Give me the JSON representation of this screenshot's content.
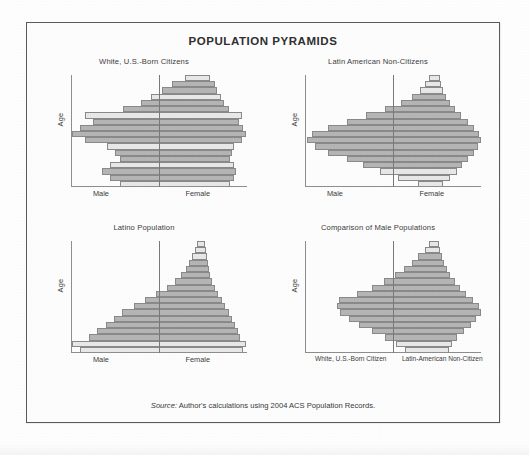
{
  "figure": {
    "title": "POPULATION PYRAMIDS",
    "source_prefix": "Source:",
    "source_text": " Author's calculations using 2004 ACS Population Records.",
    "axis_y_label": "Age",
    "bar_fill_dark": "#b6b6b6",
    "bar_fill_light": "#e9e9e9",
    "bar_stroke": "#8a8a8a",
    "border_color": "#5b5b5b"
  },
  "panels": {
    "top_left": {
      "title": "White, U.S.-Born Citizens",
      "x_left_label": "Male",
      "x_right_label": "Female"
    },
    "top_right": {
      "title": "Latin American Non-Citizens",
      "x_left_label": "Male",
      "x_right_label": "Female"
    },
    "bottom_left": {
      "title": "Latino Population",
      "x_left_label": "Male",
      "x_right_label": "Female"
    },
    "bottom_right": {
      "title": "Comparison of Male Populations",
      "x_left_label": "White, U.S.-Born Citizen",
      "x_right_label": "Latin-American Non-Citizen"
    }
  },
  "chart_data": [
    {
      "id": "top_left",
      "type": "bar",
      "orientation": "horizontal-diverging",
      "title": "White, U.S.-Born Citizens",
      "xlabel_left": "Male",
      "xlabel_right": "Female",
      "ylabel": "Age",
      "grid": false,
      "legend": "none",
      "note": "Values are relative population share per 5-year age band, youngest at bottom. Highlighted (light) rows are visually lighter bars in the scan.",
      "categories": [
        "0-4",
        "5-9",
        "10-14",
        "15-19",
        "20-24",
        "25-29",
        "30-34",
        "35-39",
        "40-44",
        "45-49",
        "50-54",
        "55-59",
        "60-64",
        "65-69",
        "70-74",
        "75-79",
        "80-84",
        "85+"
      ],
      "left_values": [
        31,
        35,
        38,
        35,
        31,
        33,
        36,
        44,
        49,
        46,
        41,
        44,
        30,
        23,
        19,
        15,
        11,
        6
      ],
      "right_values": [
        30,
        34,
        37,
        34,
        30,
        32,
        35,
        43,
        48,
        45,
        40,
        43,
        29,
        23,
        20,
        16,
        13,
        8
      ],
      "light_rows": [
        0,
        3,
        6,
        11,
        14,
        17
      ]
    },
    {
      "id": "top_right",
      "type": "bar",
      "orientation": "horizontal-diverging",
      "title": "Latin American Non-Citizens",
      "xlabel_left": "Male",
      "xlabel_right": "Female",
      "ylabel": "Age",
      "grid": false,
      "legend": "none",
      "note": "Spindle/diamond shape: very large working-age bulge, tall narrow spike of small elderly bands at top.",
      "categories": [
        "0-4",
        "5-9",
        "10-14",
        "15-19",
        "20-24",
        "25-29",
        "30-34",
        "35-39",
        "40-44",
        "45-49",
        "50-54",
        "55-59",
        "60-64",
        "65-69",
        "70-74",
        "75-79",
        "80-84",
        "85+"
      ],
      "left_values": [
        7,
        14,
        21,
        27,
        33,
        40,
        45,
        48,
        46,
        40,
        33,
        26,
        19,
        13,
        9,
        6,
        4,
        3
      ],
      "right_values": [
        7,
        15,
        22,
        28,
        34,
        41,
        46,
        49,
        47,
        41,
        34,
        27,
        20,
        14,
        10,
        7,
        5,
        3
      ],
      "light_rows": [
        0,
        1,
        2,
        15,
        16,
        17
      ]
    },
    {
      "id": "bottom_left",
      "type": "bar",
      "orientation": "horizontal-diverging",
      "title": "Latino Population",
      "xlabel_left": "Male",
      "xlabel_right": "Female",
      "ylabel": "Age",
      "grid": false,
      "legend": "none",
      "note": "Classic expansive pyramid: widest at youngest ages, tapering steadily to a narrow spike at the oldest ages.",
      "categories": [
        "0-4",
        "5-9",
        "10-14",
        "15-19",
        "20-24",
        "25-29",
        "30-34",
        "35-39",
        "40-44",
        "45-49",
        "50-54",
        "55-59",
        "60-64",
        "65-69",
        "70-74",
        "75-79",
        "80-84",
        "85+"
      ],
      "left_values": [
        44,
        47,
        41,
        38,
        35,
        32,
        29,
        25,
        21,
        17,
        13,
        10,
        8,
        6,
        5,
        4,
        3,
        2
      ],
      "right_values": [
        43,
        46,
        40,
        37,
        34,
        31,
        28,
        24,
        20,
        16,
        13,
        10,
        8,
        6,
        5,
        4,
        3,
        2
      ],
      "light_rows": [
        0,
        1,
        15,
        16,
        17
      ]
    },
    {
      "id": "bottom_right",
      "type": "bar",
      "orientation": "horizontal-diverging",
      "title": "Comparison of Male Populations",
      "xlabel_left": "White, U.S.-Born Citizen",
      "xlabel_right": "Latin-American Non-Citizen",
      "ylabel": "Age",
      "grid": false,
      "legend": "none",
      "note": "Asymmetric: left side (White U.S.-born males) is pyramid-shaped; right side (Latin-American non-citizen males) bulges strongly in prime working ages.",
      "categories": [
        "0-4",
        "5-9",
        "10-14",
        "15-19",
        "20-24",
        "25-29",
        "30-34",
        "35-39",
        "40-44",
        "45-49",
        "50-54",
        "55-59",
        "60-64",
        "65-69",
        "70-74",
        "75-79",
        "80-84",
        "85+"
      ],
      "left_values": [
        18,
        22,
        28,
        33,
        38,
        42,
        46,
        50,
        54,
        44,
        36,
        30,
        25,
        20,
        16,
        12,
        8,
        5
      ],
      "right_values": [
        20,
        26,
        34,
        46,
        58,
        68,
        76,
        72,
        62,
        50,
        40,
        31,
        23,
        17,
        12,
        8,
        5,
        3
      ],
      "light_rows": [
        0,
        1,
        16,
        17
      ]
    }
  ]
}
